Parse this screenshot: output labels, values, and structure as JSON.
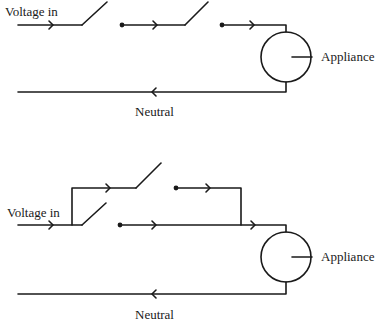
{
  "diagrams": [
    {
      "name": "two-switch-series-circuit",
      "labels": {
        "input": "Voltage in",
        "load": "Appliance",
        "neutral": "Neutral"
      }
    },
    {
      "name": "two-switch-parallel-circuit",
      "labels": {
        "input": "Voltage in",
        "load": "Appliance",
        "neutral": "Neutral"
      }
    }
  ],
  "colors": {
    "line": "#1a1a1a",
    "background": "#ffffff"
  }
}
